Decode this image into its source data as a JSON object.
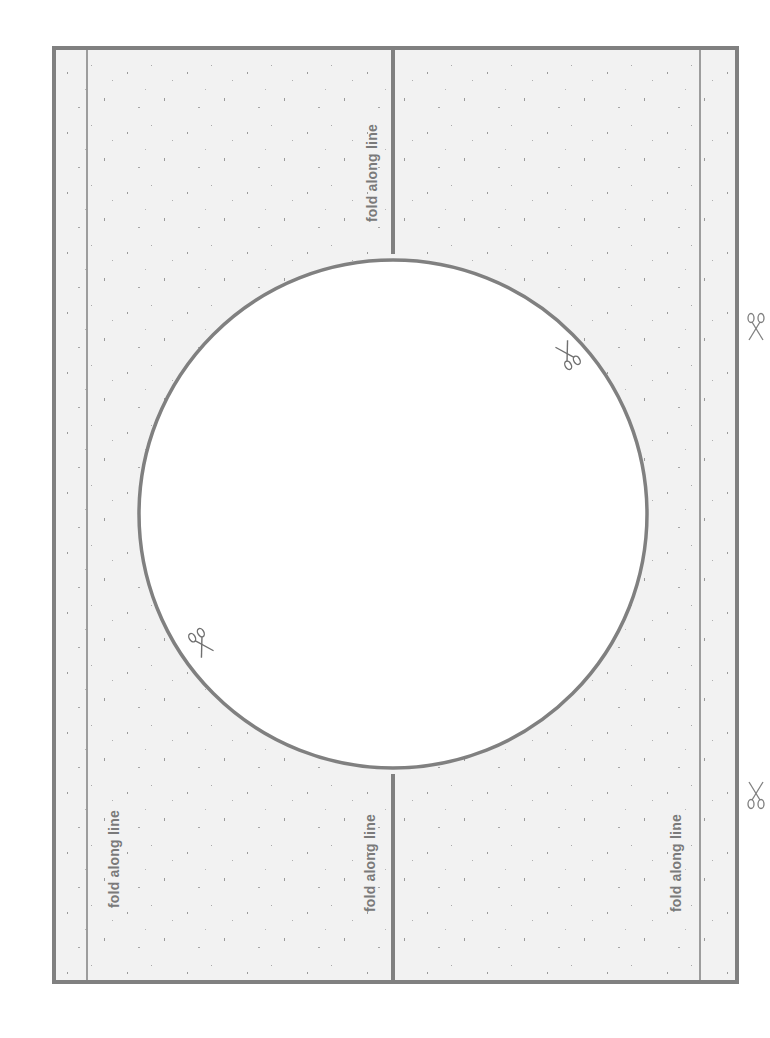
{
  "template": {
    "colors": {
      "panel_fill": "#f2f2f2",
      "line": "#808080",
      "circle_fill": "#ffffff",
      "text": "#7a7a7a"
    },
    "fold_labels": [
      {
        "text": "fold along line",
        "position": "top-right panel, left of center fold"
      },
      {
        "text": "fold along line",
        "position": "bottom-left panel, near left edge"
      },
      {
        "text": "fold along line",
        "position": "bottom-left panel, left of center fold"
      },
      {
        "text": "fold along line",
        "position": "bottom-right panel, near right fold"
      }
    ],
    "icons": [
      {
        "name": "scissors-icon",
        "location": "circle upper-right"
      },
      {
        "name": "scissors-icon",
        "location": "circle lower-left"
      },
      {
        "name": "scissors-icon",
        "location": "outside right edge, upper"
      },
      {
        "name": "scissors-icon",
        "location": "outside right edge, lower"
      }
    ]
  }
}
